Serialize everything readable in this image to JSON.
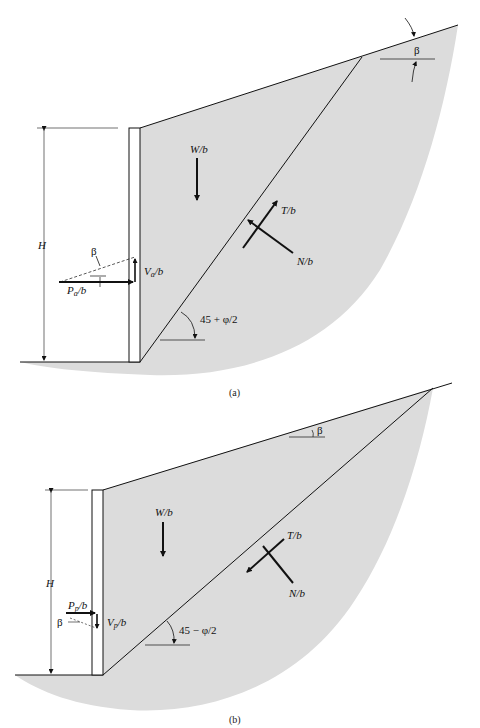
{
  "figure": {
    "panel_a": {
      "caption": "(a)",
      "labels": {
        "height": "H",
        "weight": "W/b",
        "shear": "T/b",
        "normal": "N/b",
        "active_force": "Pa/b",
        "active_force_main": "P",
        "active_force_sub": "a",
        "active_force_tail": "/b",
        "vertical_force_main": "V",
        "vertical_force_sub": "a",
        "vertical_force_tail": "/b",
        "beta_slope": "β",
        "beta_force": "β",
        "failure_angle": "45 + φ/2"
      }
    },
    "panel_b": {
      "caption": "(b)",
      "labels": {
        "height": "H",
        "weight": "W/b",
        "shear": "T/b",
        "normal": "N/b",
        "passive_force_main": "P",
        "passive_force_sub": "p",
        "passive_force_tail": "/b",
        "vertical_force_main": "V",
        "vertical_force_sub": "p",
        "vertical_force_tail": "/b",
        "beta_slope": "β",
        "beta_force": "β",
        "failure_angle": "45 − φ/2"
      }
    },
    "colors": {
      "soil_fill": "#dcdcdc",
      "line": "#111111",
      "background": "#ffffff"
    }
  }
}
